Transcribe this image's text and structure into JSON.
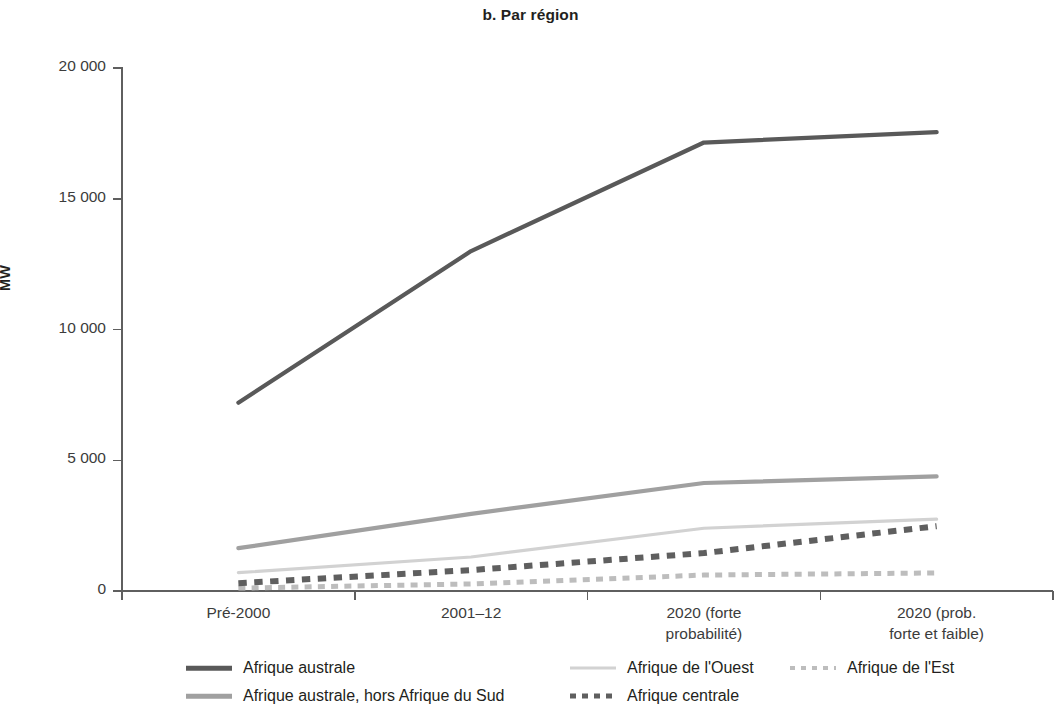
{
  "chart_data": {
    "type": "line",
    "title": "b. Par région",
    "xlabel": "",
    "ylabel": "MW",
    "categories": [
      "Pré-2000",
      "2001–12",
      "2020 (forte probabilité)",
      "2020 (prob. forte et faible)"
    ],
    "category_lines": [
      [
        "Pré-2000",
        ""
      ],
      [
        "2001–12",
        ""
      ],
      [
        "2020 (forte",
        "probabilité)"
      ],
      [
        "2020 (prob.",
        "forte et faible)"
      ]
    ],
    "ylim": [
      0,
      20000
    ],
    "yticks": [
      0,
      5000,
      10000,
      15000,
      20000
    ],
    "ytick_labels": [
      "0",
      "5 000",
      "10 000",
      "15 000",
      "20 000"
    ],
    "grid": false,
    "legend_position": "bottom",
    "series": [
      {
        "name": "Afrique australe",
        "values": [
          7200,
          13000,
          17150,
          17550
        ],
        "color": "#595959",
        "style": "solid",
        "width": 4.2
      },
      {
        "name": "Afrique australe, hors Afrique du Sud",
        "values": [
          1640,
          2950,
          4130,
          4380
        ],
        "color": "#a0a0a0",
        "style": "solid",
        "width": 4.2
      },
      {
        "name": "Afrique de l'Ouest",
        "values": [
          700,
          1300,
          2400,
          2750
        ],
        "color": "#d2d2d2",
        "style": "solid",
        "width": 3.2
      },
      {
        "name": "Afrique centrale",
        "values": [
          300,
          800,
          1450,
          2480
        ],
        "color": "#5f5f5f",
        "style": "dotted",
        "width": 6
      },
      {
        "name": "Afrique de l'Est",
        "values": [
          110,
          270,
          610,
          690
        ],
        "color": "#bdbdbd",
        "style": "dotted",
        "width": 5
      }
    ]
  },
  "legend": {
    "items": [
      {
        "label": "Afrique australe",
        "swatch": "sw-solid-dark"
      },
      {
        "label": "Afrique australe, hors Afrique du Sud",
        "swatch": "sw-solid-mid"
      },
      {
        "label": "Afrique de l'Ouest",
        "swatch": "sw-solid-light"
      },
      {
        "label": "Afrique de l'Est",
        "swatch": "sw-dot-light"
      },
      {
        "label": "Afrique centrale",
        "swatch": "sw-dot-dark"
      }
    ]
  }
}
